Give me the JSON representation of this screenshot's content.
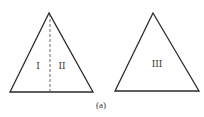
{
  "figure": {
    "caption": "(a)",
    "left_triangle": {
      "regions": [
        {
          "label": "I"
        },
        {
          "label": "II"
        }
      ],
      "divider": "dashed vertical line from apex to base midpoint"
    },
    "right_triangle": {
      "regions": [
        {
          "label": "III"
        }
      ]
    }
  }
}
